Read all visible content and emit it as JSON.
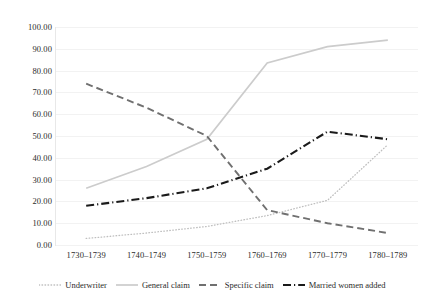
{
  "chart_data": {
    "type": "line",
    "title": "",
    "subtitle": "",
    "xlabel": "",
    "ylabel": "",
    "categories": [
      "1730–1739",
      "1740–1749",
      "1750–1759",
      "1760–1769",
      "1770–1779",
      "1780–1789"
    ],
    "ylim": [
      0,
      100
    ],
    "ytick_labels": [
      "100.00",
      "90.00",
      "80.00",
      "70.00",
      "60.00",
      "50.00",
      "40.00",
      "30.00",
      "20.00",
      "10.00",
      "0.00"
    ],
    "ytick_values": [
      100,
      90,
      80,
      70,
      60,
      50,
      40,
      30,
      20,
      10,
      0
    ],
    "grid": "horizontal",
    "legend_position": "bottom",
    "series": [
      {
        "name": "Underwriter",
        "values": [
          3.0,
          5.5,
          8.5,
          13.5,
          20.5,
          46.0
        ],
        "color": "#bfbfbf",
        "style": "dotted"
      },
      {
        "name": "General claim",
        "values": [
          26.0,
          36.0,
          48.5,
          83.5,
          91.0,
          94.0
        ],
        "color": "#cccccc",
        "style": "solid"
      },
      {
        "name": "Specific claim",
        "values": [
          74.0,
          63.0,
          50.0,
          16.0,
          10.0,
          5.5
        ],
        "color": "#707070",
        "style": "dashed"
      },
      {
        "name": "Married women added",
        "values": [
          18.0,
          21.5,
          26.0,
          35.0,
          52.0,
          48.5
        ],
        "color": "#1a1a1a",
        "style": "dash-dot"
      }
    ]
  },
  "colors": {
    "background": "#ffffff",
    "grid": "#f2f2f2",
    "axis": "#e8e8e8",
    "text": "#2b2b2b"
  }
}
